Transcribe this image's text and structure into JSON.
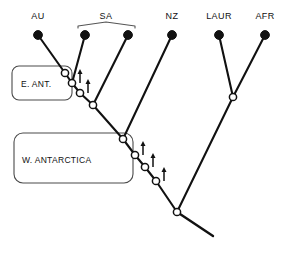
{
  "figure": {
    "width": 287,
    "height": 254,
    "background_color": "#ffffff",
    "line_color": "#111111",
    "callout_color": "#4a4a4a"
  },
  "tips": [
    {
      "id": "au",
      "label": "AU",
      "x": 38,
      "y": 35,
      "label_x": 38,
      "label_y": 19
    },
    {
      "id": "sa1",
      "label": "",
      "x": 85,
      "y": 35,
      "label_x": 85,
      "label_y": 19
    },
    {
      "id": "sa2",
      "label": "",
      "x": 128,
      "y": 35,
      "label_x": 128,
      "label_y": 19
    },
    {
      "id": "nz",
      "label": "NZ",
      "x": 172,
      "y": 35,
      "label_x": 172,
      "label_y": 19
    },
    {
      "id": "laur",
      "label": "LAUR",
      "x": 219,
      "y": 35,
      "label_x": 219,
      "label_y": 19
    },
    {
      "id": "afr",
      "label": "AFR",
      "x": 265,
      "y": 35,
      "label_x": 265,
      "label_y": 19
    }
  ],
  "bracket": {
    "label": "SA",
    "label_x": 106,
    "label_y": 19,
    "left_x": 78,
    "right_x": 135,
    "y": 26,
    "peak_x": 106,
    "peak_y": 22
  },
  "nodes": [
    {
      "id": "n1",
      "x": 65,
      "y": 73,
      "type": "open",
      "arrow": false
    },
    {
      "id": "n2",
      "x": 72,
      "y": 83,
      "type": "open",
      "arrow": true
    },
    {
      "id": "n3",
      "x": 80,
      "y": 93,
      "type": "open",
      "arrow": true
    },
    {
      "id": "n4",
      "x": 93,
      "y": 105,
      "type": "open",
      "arrow": false
    },
    {
      "id": "n5",
      "x": 123,
      "y": 139,
      "type": "open",
      "arrow": false
    },
    {
      "id": "n6",
      "x": 135,
      "y": 155,
      "type": "open",
      "arrow": true
    },
    {
      "id": "n7",
      "x": 145,
      "y": 167,
      "type": "open",
      "arrow": true
    },
    {
      "id": "n8",
      "x": 156,
      "y": 181,
      "type": "open",
      "arrow": true
    },
    {
      "id": "n9",
      "x": 177,
      "y": 212,
      "type": "open",
      "arrow": false
    },
    {
      "id": "n10",
      "x": 233,
      "y": 97,
      "type": "open",
      "arrow": false
    }
  ],
  "branches": [
    {
      "id": "b-au-n1",
      "from": [
        38,
        35
      ],
      "to": [
        65,
        73
      ]
    },
    {
      "id": "b-sa1-n2",
      "from": [
        85,
        35
      ],
      "to": [
        72,
        83
      ]
    },
    {
      "id": "b-n1-n2",
      "from": [
        65,
        73
      ],
      "to": [
        72,
        83
      ]
    },
    {
      "id": "b-n2-n3",
      "from": [
        72,
        83
      ],
      "to": [
        80,
        93
      ]
    },
    {
      "id": "b-n3-n4",
      "from": [
        80,
        93
      ],
      "to": [
        93,
        105
      ]
    },
    {
      "id": "b-sa2-n4",
      "from": [
        128,
        35
      ],
      "to": [
        93,
        105
      ]
    },
    {
      "id": "b-n4-n5",
      "from": [
        93,
        105
      ],
      "to": [
        123,
        139
      ]
    },
    {
      "id": "b-nz-n5",
      "from": [
        172,
        35
      ],
      "to": [
        123,
        139
      ]
    },
    {
      "id": "b-n5-n6",
      "from": [
        123,
        139
      ],
      "to": [
        135,
        155
      ]
    },
    {
      "id": "b-n6-n7",
      "from": [
        135,
        155
      ],
      "to": [
        145,
        167
      ]
    },
    {
      "id": "b-n7-n8",
      "from": [
        145,
        167
      ],
      "to": [
        156,
        181
      ]
    },
    {
      "id": "b-n8-n9",
      "from": [
        156,
        181
      ],
      "to": [
        177,
        212
      ]
    },
    {
      "id": "b-laur-n10",
      "from": [
        219,
        35
      ],
      "to": [
        233,
        97
      ]
    },
    {
      "id": "b-afr-n10",
      "from": [
        265,
        35
      ],
      "to": [
        233,
        97
      ]
    },
    {
      "id": "b-n10-n9",
      "from": [
        233,
        97
      ],
      "to": [
        177,
        212
      ]
    }
  ],
  "root_stem": {
    "from": [
      177,
      212
    ],
    "to": [
      213,
      236
    ]
  },
  "callouts": [
    {
      "id": "e-ant",
      "label": "E. ANT.",
      "x": 12,
      "y": 66,
      "width": 60,
      "height": 34,
      "radius": 7,
      "label_x": 21,
      "label_y": 87
    },
    {
      "id": "w-antarctica",
      "label": "W. ANTARCTICA",
      "x": 14,
      "y": 133,
      "width": 119,
      "height": 50,
      "radius": 9,
      "label_x": 22,
      "label_y": 163
    }
  ],
  "arrow": {
    "length": 14,
    "offset_x": 8,
    "head_width": 5,
    "head_height": 5
  }
}
